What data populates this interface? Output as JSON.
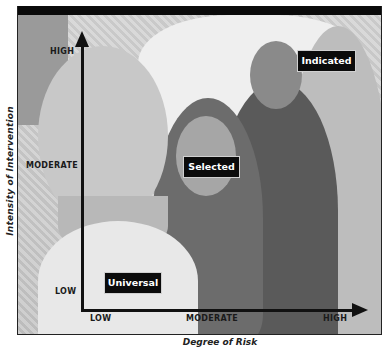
{
  "diagram": {
    "type": "two-axis intervention matrix over photo background",
    "y_axis": {
      "label": "Intensity of Intervention",
      "ticks": [
        "HIGH",
        "MODERATE",
        "LOW"
      ]
    },
    "x_axis": {
      "label": "Degree of Risk",
      "ticks": [
        "LOW",
        "MODERATE",
        "HIGH"
      ]
    },
    "boxes": [
      {
        "label": "Universal",
        "position": "low-risk / low-intensity"
      },
      {
        "label": "Selected",
        "position": "moderate-risk / moderate-intensity"
      },
      {
        "label": "Indicated",
        "position": "high-risk / high-intensity"
      }
    ],
    "colors": {
      "frame_bar": "#0a0a0a",
      "box_bg": "#0b0b0b",
      "box_text": "#ffffff",
      "axis": "#111111"
    }
  }
}
